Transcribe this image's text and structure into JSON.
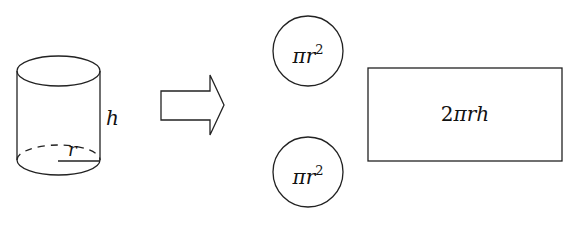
{
  "diagram": {
    "cylinder": {
      "height_label": "h",
      "radius_label": "r"
    },
    "arrow": {
      "direction": "right"
    },
    "circles": [
      {
        "label_base": "πr",
        "label_exp": "2"
      },
      {
        "label_base": "πr",
        "label_exp": "2"
      }
    ],
    "rectangle": {
      "label_coef": "2",
      "label_rest": "πrh"
    },
    "colors": {
      "stroke": "#222222",
      "background": "#ffffff"
    }
  }
}
